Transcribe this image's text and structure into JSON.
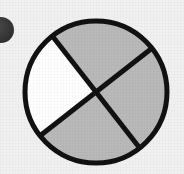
{
  "image": {
    "width": 184,
    "height": 174,
    "background_color": "#f1f1f1",
    "description": "Fraction diagram: a circle divided into four equal sectors by two crossing diagonal lines; three sectors shaded gray and one sector left white."
  },
  "figure": {
    "name": "fraction-circle",
    "shape": "circle",
    "center_x": 96,
    "center_y": 92,
    "radius": 71,
    "outline_color": "#111111",
    "outline_width": 5,
    "divider_color": "#111111",
    "divider_width": 5,
    "divider_count": 2,
    "sector_count": 4,
    "shaded_count": 3,
    "unshaded_count": 1,
    "fraction_shaded": "3/4",
    "rotation_degrees": 52,
    "shaded_color": "#b9b9b9",
    "unshaded_color": "#ffffff",
    "sectors": [
      {
        "position": "top",
        "label": "top-sector",
        "state": "shaded",
        "fill": "#b9b9b9",
        "start_angle": 232,
        "end_angle": 322
      },
      {
        "position": "right",
        "label": "right-sector",
        "state": "shaded",
        "fill": "#b9b9b9",
        "start_angle": 322,
        "end_angle": 52
      },
      {
        "position": "bottom",
        "label": "bottom-sector",
        "state": "shaded",
        "fill": "#b9b9b9",
        "start_angle": 52,
        "end_angle": 142
      },
      {
        "position": "left",
        "label": "left-sector",
        "state": "unshaded",
        "fill": "#ffffff",
        "start_angle": 142,
        "end_angle": 232
      }
    ]
  },
  "corner_mark": {
    "name": "corner-dot",
    "shape": "partial-circle",
    "center_x": 1,
    "center_y": 30,
    "radius": 13,
    "fill": "#3a3a3a",
    "description": "Dark circular mark clipped by the left edge of the image"
  }
}
